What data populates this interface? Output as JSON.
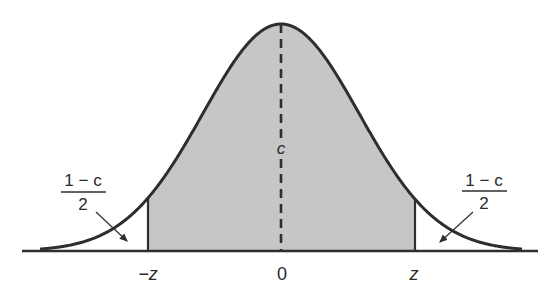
{
  "diagram": {
    "type": "standard-normal-curve-confidence-region",
    "colors": {
      "fill": "#c6c6c6",
      "stroke": "#2e2e2e",
      "background": "#ffffff"
    },
    "labels": {
      "center_area": "c",
      "left_tail": {
        "numerator": "1 − c",
        "denominator": "2"
      },
      "right_tail": {
        "numerator": "1 − c",
        "denominator": "2"
      },
      "axis": {
        "left": "−z",
        "center": "0",
        "right": "z"
      }
    }
  }
}
